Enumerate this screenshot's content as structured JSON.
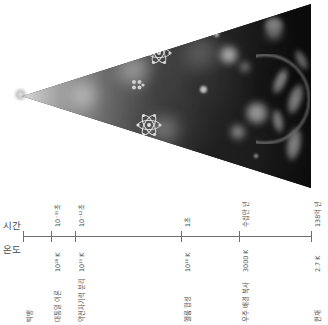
{
  "figure": {
    "type": "cosmic-timeline-diagram",
    "language": "ko",
    "axis_labels": {
      "time": "시간",
      "temperature": "온도"
    }
  },
  "chart_data": {
    "type": "timeline",
    "title": "",
    "xlabel": "시간",
    "ylabel": "온도",
    "categories": [
      "빅뱅",
      "10⁻³⁵초",
      "10⁻¹²초",
      "1초",
      "수십만 년",
      "138억 년"
    ],
    "axis_start_px": 23,
    "axis_end_px": 311,
    "ticks": [
      {
        "x": 23,
        "time": "",
        "temperature": "",
        "event": "빅뱅"
      },
      {
        "x": 51,
        "time": "10⁻³⁵초",
        "temperature": "10²⁸ K",
        "event": "대통일 이론"
      },
      {
        "x": 75,
        "time": "10⁻¹²초",
        "temperature": "10¹⁵ K",
        "event": "약전자기력 분리"
      },
      {
        "x": 181,
        "time": "1초",
        "temperature": "10¹⁰ K",
        "event": "헬륨 합성"
      },
      {
        "x": 239,
        "time": "수십만 년",
        "temperature": "3000 K",
        "event": "우주 배경 복사"
      },
      {
        "x": 311,
        "time": "138억 년",
        "temperature": "2.7 K",
        "event": "현재"
      }
    ],
    "grid": false,
    "legend": "none"
  },
  "image": {
    "name": "expanding-universe-cone",
    "description": "흑백 원뿔형 우주 팽창 이미지",
    "elements": [
      "빅뱅 점",
      "원자",
      "은하",
      "충격파"
    ]
  }
}
